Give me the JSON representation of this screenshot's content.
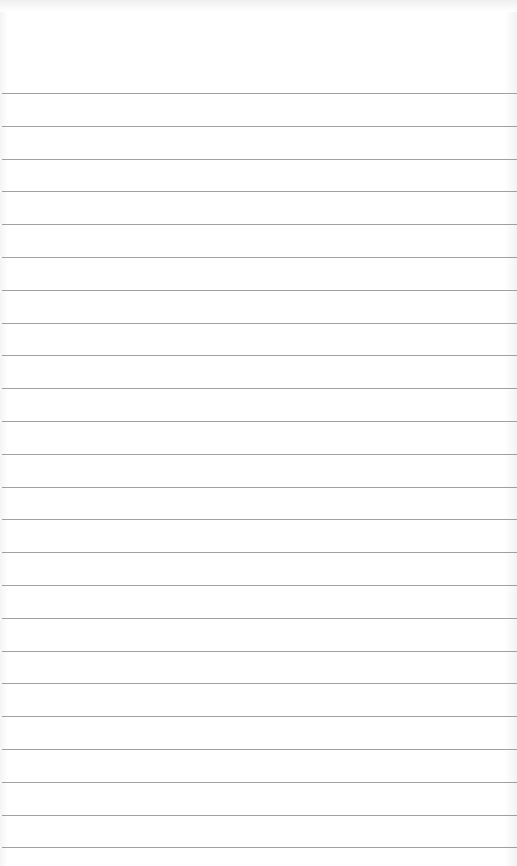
{
  "page": {
    "type": "lined-paper",
    "background_color": "#ffffff",
    "rule_color": "#8f8f8f",
    "rule_count": 24,
    "first_rule_y": 93,
    "rule_spacing": 32.8
  }
}
